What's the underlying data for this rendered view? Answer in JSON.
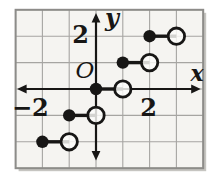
{
  "chart_data": {
    "type": "step",
    "title": "",
    "xlabel": "x",
    "ylabel": "y",
    "origin_label": "O",
    "xlim": [
      -3,
      4
    ],
    "ylim": [
      -3,
      3
    ],
    "grid": true,
    "x_tick_labels": [
      {
        "value": -2,
        "text": "−2"
      },
      {
        "value": 2,
        "text": "2"
      }
    ],
    "y_tick_labels": [
      {
        "value": 2,
        "text": "2"
      }
    ],
    "segments": [
      {
        "y": 2,
        "closed_x": 2,
        "open_x": 3
      },
      {
        "y": 1,
        "closed_x": 1,
        "open_x": 2
      },
      {
        "y": 0,
        "closed_x": 0,
        "open_x": 1
      },
      {
        "y": -1,
        "closed_x": -1,
        "open_x": 0
      },
      {
        "y": -2,
        "closed_x": -2,
        "open_x": -1
      }
    ],
    "point_style": {
      "closed": "filled black dot",
      "open": "open circle"
    }
  },
  "colors": {
    "ink": "#171615",
    "grid": "#a6a5a2",
    "frame": "#8d8c89",
    "paper": "#f5f4f1",
    "page": "#ffffff",
    "shadow": "#c6c5c1",
    "open_fill": "#fcfcfa"
  }
}
